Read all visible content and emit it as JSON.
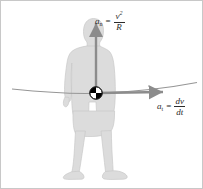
{
  "figure": {
    "domain": "diagram",
    "width": 203,
    "height": 189,
    "background_color": "#ffffff",
    "border_color": "#c8c8c8"
  },
  "labels": {
    "normal_acceleration": {
      "symbol": "a",
      "subscript": "n",
      "equals": "=",
      "numerator": "v",
      "numerator_exponent": "2",
      "denominator": "R",
      "full_text": "a_n = v^2 / R"
    },
    "tangential_acceleration": {
      "symbol": "a",
      "subscript": "t",
      "equals": "=",
      "numerator": "dv",
      "denominator": "dt",
      "full_text": "a_t = dv / dt"
    }
  },
  "graphics": {
    "silhouette": {
      "name": "human-silhouette",
      "fill_color": "#dcdcdc",
      "stroke_color": "#c4c4c4"
    },
    "normal_arrow": {
      "name": "normal-acceleration-arrow",
      "color": "#8c8c8c",
      "direction": "up",
      "from": [
        95,
        92
      ],
      "to": [
        95,
        20
      ]
    },
    "tangential_arrow": {
      "name": "tangential-acceleration-arrow",
      "color": "#8c8c8c",
      "direction": "right",
      "from": [
        95,
        92
      ],
      "to": [
        167,
        92
      ]
    },
    "trajectory_curve": {
      "name": "trajectory-curve",
      "color": "#969696",
      "from": [
        11,
        88
      ],
      "through": [
        95,
        92
      ],
      "to": [
        196,
        82
      ]
    },
    "center_of_mass_marker": {
      "name": "center-of-mass-marker",
      "quadrant_fill": "#000000",
      "quadrant_alt_fill": "#ffffff",
      "center": [
        95,
        92
      ],
      "radius": 6
    }
  }
}
